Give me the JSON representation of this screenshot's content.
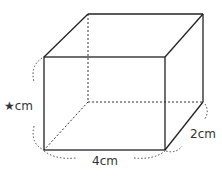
{
  "figure": {
    "type": "rectangular-prism",
    "labels": {
      "height": "★cm",
      "width": "4cm",
      "depth": "2cm"
    },
    "colors": {
      "edge": "#222222",
      "label": "#333333",
      "background": "#ffffff"
    }
  }
}
